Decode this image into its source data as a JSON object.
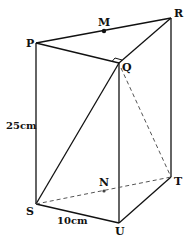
{
  "diagram": {
    "type": "triangular-prism",
    "colors": {
      "line": "#111111",
      "background": "#ffffff"
    },
    "points": {
      "P": {
        "label": "P",
        "x": 36,
        "y": 43
      },
      "M": {
        "label": "M",
        "x": 104,
        "y": 31
      },
      "R": {
        "label": "R",
        "x": 171,
        "y": 18
      },
      "Q": {
        "label": "Q",
        "x": 119,
        "y": 63
      },
      "S": {
        "label": "S",
        "x": 36,
        "y": 204
      },
      "N": {
        "label": "N",
        "x": 104,
        "y": 191
      },
      "T": {
        "label": "T",
        "x": 171,
        "y": 177
      },
      "U": {
        "label": "U",
        "x": 119,
        "y": 223
      }
    },
    "solid_edges": [
      [
        "P",
        "R"
      ],
      [
        "P",
        "Q"
      ],
      [
        "Q",
        "R"
      ],
      [
        "P",
        "S"
      ],
      [
        "Q",
        "U"
      ],
      [
        "R",
        "T"
      ],
      [
        "S",
        "U"
      ],
      [
        "U",
        "T"
      ],
      [
        "S",
        "Q"
      ]
    ],
    "dashed_edges": [
      [
        "S",
        "T"
      ],
      [
        "Q",
        "T"
      ]
    ],
    "right_angle_at": "Q",
    "dimensions": {
      "height": "25cm",
      "base": "10cm"
    }
  }
}
